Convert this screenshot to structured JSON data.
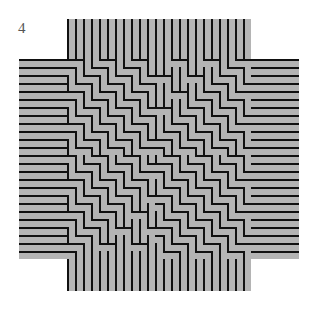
{
  "figure": {
    "label": "4",
    "colors": {
      "strip_fill": "#b4b4b4",
      "strip_line": "#111111",
      "background": "#ffffff",
      "label": "#555555"
    },
    "geometry": {
      "pitch": 8,
      "outer": {
        "x0": 19,
        "y0": 19,
        "x1": 296,
        "y1": 291
      },
      "vertical_arm": {
        "x0": 66,
        "x1": 254
      },
      "horizontal_arm": {
        "y0": 60,
        "y1": 256
      }
    }
  }
}
